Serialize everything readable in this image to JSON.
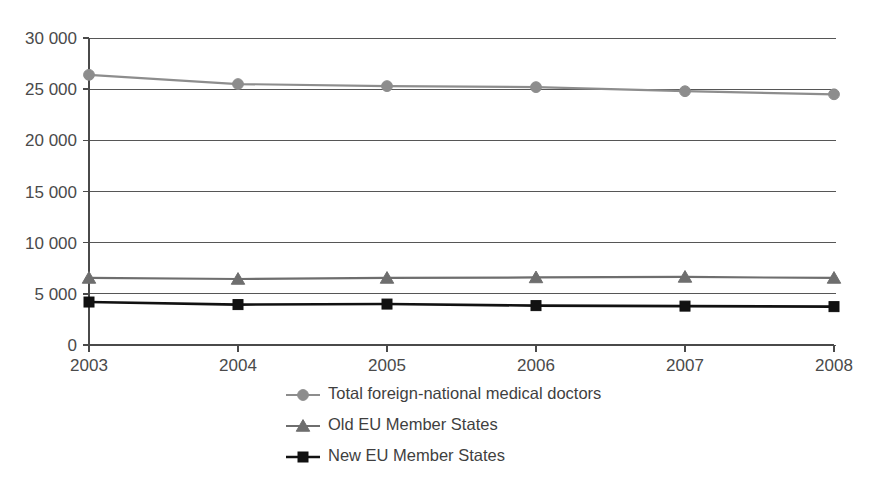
{
  "chart_data": {
    "type": "line",
    "title": "",
    "subtitle": "",
    "xlabel": "",
    "ylabel": "",
    "categories": [
      "2003",
      "2004",
      "2005",
      "2006",
      "2007",
      "2008"
    ],
    "x": [
      2003,
      2004,
      2005,
      2006,
      2007,
      2008
    ],
    "xlim": [
      2003,
      2008
    ],
    "ylim": [
      0,
      30000
    ],
    "y_ticks": [
      0,
      5000,
      10000,
      15000,
      20000,
      25000,
      30000
    ],
    "y_tick_labels": [
      "0",
      "5 000",
      "10 000",
      "15 000",
      "20 000",
      "25 000",
      "30 000"
    ],
    "x_tick_labels": [
      "2003",
      "2004",
      "2005",
      "2006",
      "2007",
      "2008"
    ],
    "grid": "horizontal",
    "legend_position": "bottom-center",
    "series": [
      {
        "name": "Total foreign-national medical doctors",
        "marker": "circle",
        "color": "#8d8d8d",
        "values": [
          26400,
          25500,
          25300,
          25200,
          24800,
          24500
        ]
      },
      {
        "name": "Old EU Member States",
        "marker": "triangle",
        "color": "#6e6e6e",
        "values": [
          6550,
          6450,
          6550,
          6600,
          6650,
          6550
        ]
      },
      {
        "name": "New EU Member States",
        "marker": "square",
        "color": "#111111",
        "values": [
          4200,
          3950,
          4000,
          3850,
          3800,
          3750
        ]
      }
    ],
    "legend": [
      {
        "label": "Total foreign-national medical doctors",
        "marker": "circle",
        "color": "#8d8d8d"
      },
      {
        "label": "Old EU Member States",
        "marker": "triangle",
        "color": "#6e6e6e"
      },
      {
        "label": "New EU Member States",
        "marker": "square",
        "color": "#111111"
      }
    ]
  },
  "colors": {
    "background": "#ffffff",
    "axis": "#4a4a4a",
    "grid": "#565656",
    "text": "#3f3f3f",
    "series_total": "#8d8d8d",
    "series_old": "#6e6e6e",
    "series_new": "#111111"
  }
}
